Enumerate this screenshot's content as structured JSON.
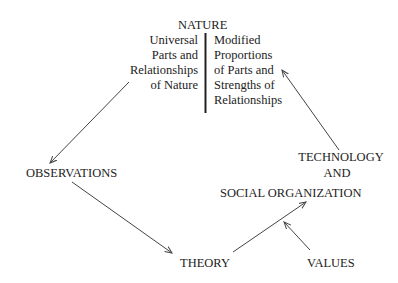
{
  "diagram": {
    "nature": {
      "title": "NATURE",
      "left_lines": [
        "Universal",
        "Parts and",
        "Relationships",
        "of Nature"
      ],
      "right_lines": [
        "Modified",
        "Proportions",
        "of Parts and",
        "Strengths of",
        "Relationships"
      ]
    },
    "nodes": {
      "observations": "OBSERVATIONS",
      "technology_line1": "TECHNOLOGY",
      "technology_line2": "AND",
      "technology_line3": "SOCIAL ORGANIZATION",
      "theory": "THEORY",
      "values": "VALUES"
    },
    "edges": [
      {
        "from": "NATURE (Universal Parts and Relationships of Nature)",
        "to": "OBSERVATIONS"
      },
      {
        "from": "OBSERVATIONS",
        "to": "THEORY"
      },
      {
        "from": "THEORY",
        "to": "TECHNOLOGY AND SOCIAL ORGANIZATION"
      },
      {
        "from": "VALUES",
        "to": "TECHNOLOGY AND SOCIAL ORGANIZATION"
      },
      {
        "from": "TECHNOLOGY AND SOCIAL ORGANIZATION",
        "to": "NATURE (Modified Proportions of Parts and Strengths of Relationships)"
      }
    ],
    "colors": {
      "text": "#222222",
      "line": "#444444",
      "background": "#ffffff"
    }
  }
}
